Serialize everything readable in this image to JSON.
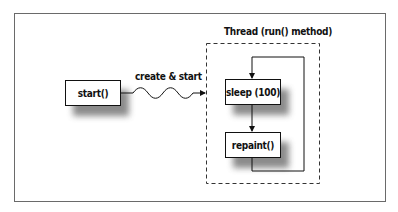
{
  "diagram": {
    "nodes": {
      "start": {
        "label": "start()"
      },
      "sleep": {
        "label": "sleep (100)"
      },
      "repaint": {
        "label": "repaint()"
      }
    },
    "edges": {
      "create_start": {
        "label": "create & start"
      }
    },
    "groups": {
      "thread": {
        "label": "Thread (run() method)"
      }
    }
  }
}
